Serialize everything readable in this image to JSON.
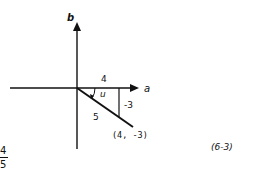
{
  "diagram": {
    "axes": {
      "vertical_label": "b",
      "horizontal_label": "a"
    },
    "vector": {
      "point_label": "(4, -3)",
      "length_label": "5",
      "angle_label": "u"
    },
    "legs": {
      "horizontal_label": "4",
      "vertical_label": "-3"
    },
    "equation_number": "(6-3)",
    "fraction": {
      "numerator": "4",
      "denominator": "5"
    },
    "colors": {
      "ink": "#111111",
      "background": "#ffffff"
    }
  }
}
